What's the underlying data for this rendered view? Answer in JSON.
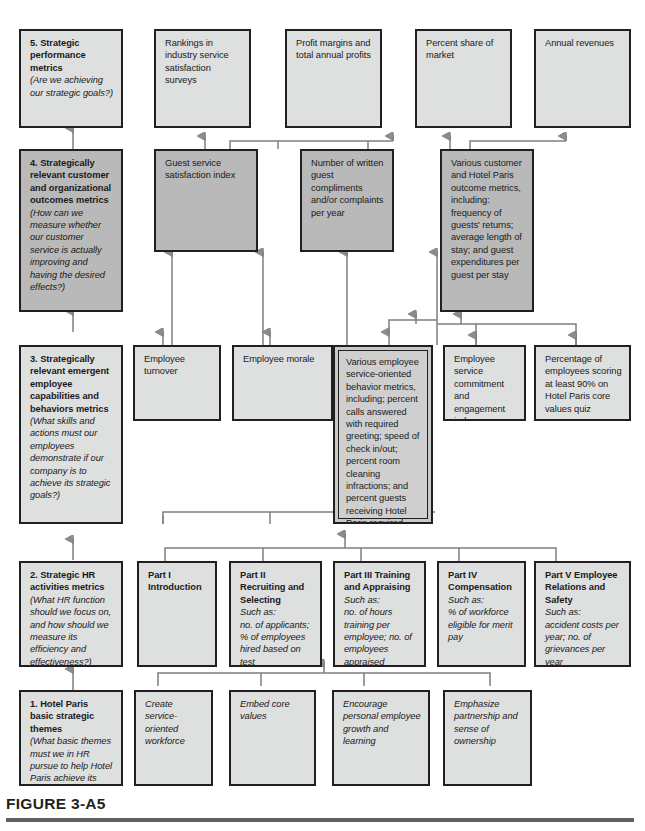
{
  "figure": {
    "caption": "FIGURE 3-A5",
    "title_hidden": ""
  },
  "colors": {
    "box_border": "#231f20",
    "fill_light": "#dedfdf",
    "fill_mid": "#b9b9b9",
    "fill_inner": "#c9c9c9",
    "rule": "#5e6063",
    "wire": "#6f7173"
  },
  "levels": {
    "level5": {
      "number": "5.",
      "heading": "Strategic performance metrics",
      "question": "(Are we achieving our strategic goals?)"
    },
    "level4": {
      "number": "4.",
      "heading": "Strategically relevant customer and organizational outcomes metrics",
      "question": "(How can we measure whether our customer service is actually improving and having the desired effects?)"
    },
    "level3": {
      "number": "3.",
      "heading": "Strategically relevant emergent employee capabilities and behaviors metrics",
      "question": "(What skills and actions must our employees demonstrate if our company is to achieve its strategic goals?)"
    },
    "level2": {
      "number": "2.",
      "heading": "Strategic HR activities metrics",
      "question": "(What HR function should we focus on, and how should we measure its efficiency and effectiveness?)"
    },
    "level1": {
      "number": "1.",
      "heading": "Hotel Paris basic strategic themes",
      "question": "(What basic themes must we in HR pursue to help Hotel Paris achieve its strategic goals?)"
    }
  },
  "row5_metrics": [
    {
      "text": "Rankings in industry service satisfaction surveys"
    },
    {
      "text": "Profit margins and total annual profits"
    },
    {
      "text": "Percent share of market"
    },
    {
      "text": "Annual revenues"
    }
  ],
  "row4_metrics": [
    {
      "text": "Guest service satisfaction index"
    },
    {
      "text": "Number of written guest compliments and/or complaints per year"
    },
    {
      "text": "Various customer and Hotel Paris outcome metrics, including: frequency of guests' returns; average length of stay; and guest expenditures per guest per stay"
    }
  ],
  "row3_metrics": [
    {
      "text": "Employee turnover"
    },
    {
      "text": "Employee morale"
    },
    {
      "text": "Various employee service-oriented behavior metrics, including; percent calls answered with required greeting; speed of check in/out; percent room cleaning infractions; and percent guests receiving Hotel Paris required greeting on arrival"
    },
    {
      "text": "Employee service commitment and engagement index"
    },
    {
      "text": "Percentage of employees scoring at least 90% on Hotel Paris core values quiz"
    }
  ],
  "row2_parts": [
    {
      "title": "Part I Introduction",
      "suchas": "",
      "examples": ""
    },
    {
      "title": "Part II Recruiting and Selecting",
      "suchas": "Such as:",
      "examples": "no. of applicants; % of employees hired based on test"
    },
    {
      "title": "Part III Training and Appraising",
      "suchas": "Such as:",
      "examples": "no. of hours training per employee; no. of employees appraised"
    },
    {
      "title": "Part IV Compensation",
      "suchas": "Such as:",
      "examples": "% of workforce eligible for merit pay"
    },
    {
      "title": "Part V Employee Relations and Safety",
      "suchas": "Such as:",
      "examples": "accident costs per year; no. of grievances per year"
    }
  ],
  "row1_themes": [
    {
      "text": "Create service-oriented workforce"
    },
    {
      "text": "Embed core values"
    },
    {
      "text": "Encourage personal employee growth and learning"
    },
    {
      "text": "Emphasize partnership and sense of ownership"
    }
  ]
}
